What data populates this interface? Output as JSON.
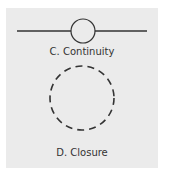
{
  "panels": [
    {
      "id": "continuity",
      "label": "C. Continuity",
      "shape": "line-through-circle"
    },
    {
      "id": "closure",
      "label": "D. Closure",
      "shape": "dashed-circle"
    }
  ],
  "colors": {
    "background": "#ebebeb",
    "stroke": "#333333",
    "text": "#333333"
  }
}
